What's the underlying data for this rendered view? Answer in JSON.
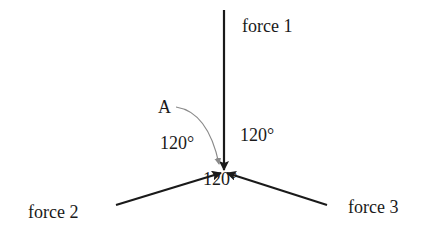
{
  "diagram": {
    "point_label": "A",
    "forces": [
      {
        "label": "force 1"
      },
      {
        "label": "force 2"
      },
      {
        "label": "force 3"
      }
    ],
    "angles": [
      {
        "label": "120°"
      },
      {
        "label": "120°"
      },
      {
        "label": "120°"
      }
    ],
    "colors": {
      "line": "#1a1a1a",
      "pointer": "#8a8a8a",
      "text": "#1a1a1a"
    }
  }
}
